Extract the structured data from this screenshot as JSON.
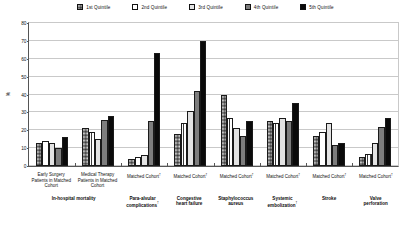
{
  "chart_data": {
    "type": "bar",
    "title": "",
    "xlabel": "",
    "ylabel": "%",
    "ylim": [
      0,
      80
    ],
    "yticks": [
      0,
      10,
      20,
      30,
      40,
      50,
      60,
      70,
      80
    ],
    "grid": true,
    "legend_position": "top-center",
    "categories": [
      "Early Surgery Patients in Matched Cohort",
      "Medical Therapy Patients in Matched Cohort",
      "Matched Cohort",
      "Matched Cohort",
      "Matched Cohort",
      "Matched Cohort",
      "Matched Cohort",
      "Matched Cohort"
    ],
    "group_labels": [
      "In-hospital mortality",
      "Para-alvular complications",
      "Congestive heart failure",
      "Staphylococcus aureus",
      "Systemic embolization",
      "Stroke",
      "Valve perforation"
    ],
    "series": [
      {
        "name": "1st Quintile",
        "color": "#777777",
        "values": [
          13,
          21,
          4,
          18,
          40,
          25,
          17,
          5
        ]
      },
      {
        "name": "2nd Quintile",
        "color": "#ffffff",
        "values": [
          14,
          19,
          5,
          24,
          27,
          24,
          19,
          7
        ]
      },
      {
        "name": "3rd Quintile",
        "color": "#e3e3e3",
        "values": [
          13,
          15,
          6,
          31,
          21,
          27,
          24,
          13
        ]
      },
      {
        "name": "4th Quintile",
        "color": "#7d7d7d",
        "values": [
          10,
          26,
          25,
          42,
          17,
          25,
          12,
          22
        ]
      },
      {
        "name": "5th Quintile",
        "color": "#0a0a0a",
        "values": [
          16,
          28,
          63,
          70,
          25,
          35,
          13,
          27
        ]
      }
    ]
  },
  "legend": {
    "items": [
      {
        "label": "1st Quintile",
        "swatch": "pattern-checker"
      },
      {
        "label": "2nd Quintile",
        "swatch": "pattern-vertical-stripes"
      },
      {
        "label": "3rd Quintile",
        "swatch": "solid-light-gray"
      },
      {
        "label": "4th Quintile",
        "swatch": "solid-medium-gray"
      },
      {
        "label": "5th Quintile",
        "swatch": "solid-black"
      }
    ]
  },
  "axis": {
    "y_title": "%",
    "y_tick_labels": [
      "0",
      "10",
      "20",
      "30",
      "40",
      "50",
      "60",
      "70",
      "80"
    ]
  },
  "x_axis_labels": [
    {
      "line1": "Early Surgery",
      "line2": "Patients in Matched",
      "line3": "Cohort",
      "dagger": false
    },
    {
      "line1": "Medical Therapy",
      "line2": "Patients in Matched",
      "line3": "Cohort",
      "dagger": false
    },
    {
      "line1": "Matched Cohort",
      "line2": "",
      "line3": "",
      "dagger": true
    },
    {
      "line1": "Matched Cohort",
      "line2": "",
      "line3": "",
      "dagger": true
    },
    {
      "line1": "Matched Cohort",
      "line2": "",
      "line3": "",
      "dagger": true
    },
    {
      "line1": "Matched Cohort",
      "line2": "",
      "line3": "",
      "dagger": true
    },
    {
      "line1": "Matched Cohort",
      "line2": "",
      "line3": "",
      "dagger": true
    },
    {
      "line1": "Matched Cohort",
      "line2": "",
      "line3": "",
      "dagger": true
    }
  ],
  "group_axis_labels": [
    {
      "line1": "In-hospital mortality",
      "line2": "",
      "dagger": false,
      "span": 2
    },
    {
      "line1": "Para-alvular",
      "line2": "complications",
      "dagger": true,
      "span": 1
    },
    {
      "line1": "Congestive",
      "line2": "heart failure",
      "dagger": false,
      "span": 1
    },
    {
      "line1": "Staphylococcus",
      "line2": "aureus",
      "dagger": false,
      "span": 1
    },
    {
      "line1": "Systemic",
      "line2": "embolization",
      "dagger": true,
      "span": 1
    },
    {
      "line1": "Stroke",
      "line2": "",
      "dagger": false,
      "span": 1
    },
    {
      "line1": "Valve",
      "line2": "perforation",
      "dagger": false,
      "span": 1
    }
  ]
}
